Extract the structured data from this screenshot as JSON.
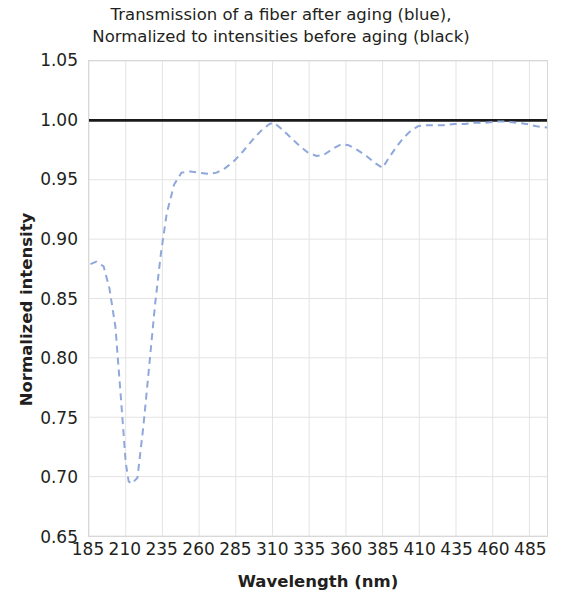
{
  "chart_data": {
    "type": "line",
    "title": "Transmission of a fiber after aging (blue),\nNormalized to intensities before aging (black)",
    "title_line1": "Transmission of a fiber after aging (blue),",
    "title_line2": "Normalized to intensities before aging (black)",
    "xlabel": "Wavelength (nm)",
    "ylabel": "Normalized intensity",
    "xlim": [
      185,
      497
    ],
    "ylim": [
      0.65,
      1.05
    ],
    "xticks": [
      185,
      210,
      235,
      260,
      285,
      310,
      335,
      360,
      385,
      410,
      435,
      460,
      485
    ],
    "xticklabels": [
      "185",
      "210",
      "235",
      "260",
      "285",
      "310",
      "335",
      "360",
      "385",
      "410",
      "435",
      "460",
      "485"
    ],
    "yticks": [
      0.65,
      0.7,
      0.75,
      0.8,
      0.85,
      0.9,
      0.95,
      1.0,
      1.05
    ],
    "yticklabels": [
      "0.65",
      "0.70",
      "0.75",
      "0.80",
      "0.85",
      "0.90",
      "0.95",
      "1.00",
      "1.05"
    ],
    "grid": true,
    "legend": null,
    "series": [
      {
        "name": "Reference (before aging)",
        "color": "#1a1a1a",
        "style": "solid",
        "width": 3,
        "x": [
          185,
          497
        ],
        "values": [
          1.0,
          1.0
        ]
      },
      {
        "name": "After aging (normalized)",
        "color": "#8fa8dc",
        "style": "dashed",
        "width": 2,
        "x": [
          186,
          190,
          195,
          199,
          203,
          207,
          210,
          212,
          214,
          218,
          222,
          226,
          230,
          234,
          238,
          243,
          248,
          254,
          260,
          266,
          272,
          278,
          284,
          290,
          296,
          302,
          308,
          311,
          316,
          322,
          328,
          334,
          340,
          345,
          351,
          357,
          362,
          368,
          374,
          380,
          385,
          389,
          394,
          399,
          404,
          409,
          414,
          420,
          427,
          434,
          441,
          448,
          455,
          462,
          469,
          476,
          483,
          490,
          497
        ],
        "values": [
          0.879,
          0.881,
          0.877,
          0.858,
          0.826,
          0.762,
          0.712,
          0.696,
          0.694,
          0.699,
          0.742,
          0.793,
          0.845,
          0.888,
          0.922,
          0.946,
          0.956,
          0.957,
          0.956,
          0.955,
          0.956,
          0.96,
          0.966,
          0.974,
          0.983,
          0.991,
          0.997,
          0.998,
          0.993,
          0.986,
          0.979,
          0.973,
          0.97,
          0.971,
          0.976,
          0.98,
          0.979,
          0.975,
          0.97,
          0.964,
          0.96,
          0.968,
          0.977,
          0.985,
          0.991,
          0.995,
          0.996,
          0.996,
          0.996,
          0.997,
          0.997,
          0.998,
          0.998,
          0.999,
          0.999,
          0.998,
          0.997,
          0.995,
          0.994
        ]
      }
    ]
  }
}
